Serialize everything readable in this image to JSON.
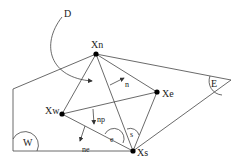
{
  "diagram": {
    "nodes": [
      {
        "id": "Xn",
        "label": "Xn",
        "x": 96,
        "y": 54
      },
      {
        "id": "Xw",
        "label": "Xw",
        "x": 62,
        "y": 114
      },
      {
        "id": "Xe",
        "label": "Xe",
        "x": 157,
        "y": 92
      },
      {
        "id": "Xs",
        "label": "Xs",
        "x": 133,
        "y": 151
      }
    ],
    "regions": {
      "D": "D",
      "E": "E",
      "W": "W"
    },
    "angles": {
      "s": "s",
      "e": "e"
    },
    "vectors": {
      "n": "n",
      "np": "np",
      "ne": "ne"
    },
    "colors": {
      "line": "#444444",
      "node": "#000000",
      "text": "#222222",
      "background": "#ffffff"
    }
  }
}
